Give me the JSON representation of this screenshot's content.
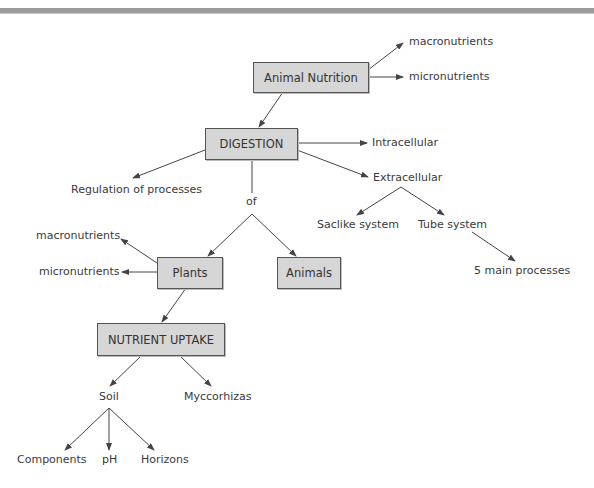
{
  "diagram": {
    "nodes": {
      "animal_nutrition": "Animal Nutrition",
      "digestion": "DIGESTION",
      "plants": "Plants",
      "animals": "Animals",
      "nutrient_uptake": "NUTRIENT UPTAKE"
    },
    "labels": {
      "top_macronutrients": "macronutrients",
      "top_micronutrients": "micronutrients",
      "intracellular": "Intracellular",
      "extracellular": "Extracellular",
      "regulation": "Regulation of processes",
      "of": "of",
      "saclike": "Saclike system",
      "tube": "Tube system",
      "five_processes": "5 main processes",
      "plant_macronutrients": "macronutrients",
      "plant_micronutrients": "micronutrients",
      "soil": "Soil",
      "myccorhizas": "Myccorhizas",
      "components": "Components",
      "ph": "pH",
      "horizons": "Horizons"
    },
    "colors": {
      "box_fill": "#d6d6d6",
      "box_border": "#555555",
      "line": "#444444",
      "top_band": "#9a9a9a"
    }
  }
}
